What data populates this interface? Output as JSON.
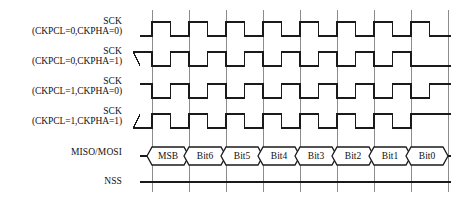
{
  "diagram": {
    "line_color": "#1a1a1a",
    "grid_color": "#8c8c8c",
    "background": "#ffffff"
  },
  "rows": [
    {
      "name": "sck-cpol0-cpha0",
      "label_line1": "SCK",
      "label_line2": "(CKPCL=0,CKPHA=0)",
      "idle_level": "low",
      "phase": "aligned"
    },
    {
      "name": "sck-cpol0-cpha1",
      "label_line1": "SCK",
      "label_line2": "(CKPCL=0,CKPHA=1)",
      "idle_level": "low",
      "phase": "shifted"
    },
    {
      "name": "sck-cpol1-cpha0",
      "label_line1": "SCK",
      "label_line2": "(CKPCL=1,CKPHA=0)",
      "idle_level": "high",
      "phase": "aligned"
    },
    {
      "name": "sck-cpol1-cpha1",
      "label_line1": "SCK",
      "label_line2": "(CKPCL=1,CKPHA=1)",
      "idle_level": "high",
      "phase": "shifted"
    },
    {
      "name": "miso-mosi",
      "label_line1": "MISO/MOSI",
      "label_line2": "",
      "idle_level": "data",
      "phase": "data"
    },
    {
      "name": "nss",
      "label_line1": "NSS",
      "label_line2": "",
      "idle_level": "low",
      "phase": "static"
    }
  ],
  "data_bits": [
    "MSB",
    "Bit6",
    "Bit5",
    "Bit4",
    "Bit3",
    "Bit2",
    "Bit1",
    "Bit0"
  ],
  "timing": {
    "bit_count": 8,
    "gridline_count": 9,
    "clock_pulses": 8
  }
}
